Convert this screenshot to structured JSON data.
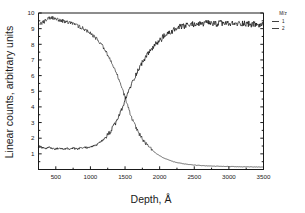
{
  "chart_data": {
    "type": "line",
    "title": "",
    "xlabel": "Depth, Å",
    "ylabel": "Linear counts, arbitrary units",
    "xlim": [
      250,
      3500
    ],
    "ylim": [
      0,
      10
    ],
    "grid": false,
    "legend_position": "right",
    "legend_title": "M/z",
    "xticks": [
      500,
      1000,
      1500,
      2000,
      2500,
      3000,
      3500
    ],
    "xtick_labels": [
      "500",
      "1000",
      "1500",
      "2000",
      "2500",
      "3000",
      "3500"
    ],
    "yticks": [
      1,
      2,
      3,
      4,
      5,
      6,
      7,
      8,
      9,
      10
    ],
    "ytick_labels": [
      "1",
      "2",
      "3",
      "4",
      "5",
      "6",
      "7",
      "8",
      "9",
      "10"
    ],
    "series": [
      {
        "name": "1",
        "description": "descending profile, starts high near surface and decays to baseline past 2300 A",
        "x": [
          250,
          300,
          350,
          400,
          450,
          500,
          550,
          600,
          650,
          700,
          750,
          800,
          850,
          900,
          950,
          1000,
          1050,
          1100,
          1150,
          1200,
          1250,
          1300,
          1350,
          1400,
          1450,
          1500,
          1550,
          1600,
          1650,
          1700,
          1750,
          1800,
          1850,
          1900,
          1950,
          2000,
          2050,
          2100,
          2150,
          2200,
          2250,
          2300,
          2400,
          2500,
          2600,
          2700,
          2800,
          2900,
          3000,
          3100,
          3200,
          3300,
          3400,
          3500
        ],
        "values": [
          9.2,
          9.35,
          9.5,
          9.65,
          9.7,
          9.6,
          9.55,
          9.5,
          9.4,
          9.35,
          9.3,
          9.2,
          9.1,
          9.0,
          8.85,
          8.7,
          8.5,
          8.3,
          8.05,
          7.7,
          7.3,
          6.85,
          6.4,
          5.9,
          5.3,
          4.6,
          3.9,
          3.25,
          2.75,
          2.3,
          1.95,
          1.65,
          1.4,
          1.2,
          1.02,
          0.88,
          0.76,
          0.66,
          0.58,
          0.5,
          0.44,
          0.4,
          0.33,
          0.28,
          0.25,
          0.23,
          0.21,
          0.2,
          0.19,
          0.18,
          0.17,
          0.17,
          0.16,
          0.16
        ]
      },
      {
        "name": "2",
        "description": "ascending profile, flat baseline then rises to noisy plateau near 9.3",
        "x": [
          250,
          300,
          350,
          400,
          450,
          500,
          550,
          600,
          650,
          700,
          750,
          800,
          850,
          900,
          950,
          1000,
          1050,
          1100,
          1150,
          1200,
          1250,
          1300,
          1350,
          1400,
          1450,
          1500,
          1550,
          1600,
          1650,
          1700,
          1750,
          1800,
          1850,
          1900,
          1950,
          2000,
          2050,
          2100,
          2150,
          2200,
          2250,
          2300,
          2350,
          2400,
          2500,
          2600,
          2700,
          2800,
          2900,
          3000,
          3100,
          3200,
          3300,
          3400,
          3500
        ],
        "values": [
          1.45,
          1.4,
          1.35,
          1.4,
          1.35,
          1.3,
          1.35,
          1.3,
          1.35,
          1.3,
          1.35,
          1.3,
          1.35,
          1.4,
          1.4,
          1.45,
          1.5,
          1.6,
          1.75,
          1.95,
          2.2,
          2.5,
          2.85,
          3.3,
          3.8,
          4.4,
          5.0,
          5.5,
          6.0,
          6.45,
          6.85,
          7.2,
          7.5,
          7.8,
          8.0,
          8.25,
          8.45,
          8.6,
          8.75,
          8.9,
          9.0,
          9.1,
          9.15,
          9.2,
          9.3,
          9.3,
          9.35,
          9.3,
          9.35,
          9.3,
          9.3,
          9.35,
          9.3,
          9.25,
          9.2
        ]
      }
    ],
    "crossover": {
      "x": 1500,
      "y": 4.4
    }
  },
  "legend": {
    "title": "M/z",
    "entries": [
      {
        "label": "1"
      },
      {
        "label": "2"
      }
    ]
  },
  "axes": {
    "x_title": "Depth, Å",
    "y_title": "Linear counts, arbitrary units"
  },
  "colors": {
    "line": "#111111",
    "axis": "#1a1a1a",
    "background": "#ffffff"
  }
}
